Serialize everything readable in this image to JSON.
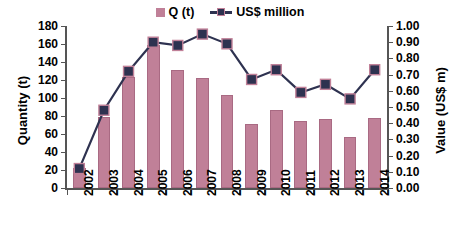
{
  "chart_data": {
    "type": "bar",
    "title": "",
    "subtitle": "",
    "xlabel": "",
    "ylabel": "Quantity (t)",
    "y2label": "Value (US$ m)",
    "categories": [
      "2002",
      "2003",
      "2004",
      "2005",
      "2006",
      "2007",
      "2008",
      "2009",
      "2010",
      "2011",
      "2012",
      "2013",
      "2014"
    ],
    "ylim": [
      0,
      180
    ],
    "y2lim": [
      0,
      1.0
    ],
    "yticks": [
      0,
      20,
      40,
      60,
      80,
      100,
      120,
      140,
      160,
      180
    ],
    "ytick_labels": [
      "0",
      "20",
      "40",
      "60",
      "80",
      "100",
      "120",
      "140",
      "160",
      "180"
    ],
    "y2ticks": [
      0.0,
      0.1,
      0.2,
      0.3,
      0.4,
      0.5,
      0.6,
      0.7,
      0.8,
      0.9,
      1.0
    ],
    "y2tick_labels": [
      "0.00",
      "0.10",
      "0.20",
      "0.30",
      "0.40",
      "0.50",
      "0.60",
      "0.70",
      "0.80",
      "0.90",
      "1.00"
    ],
    "grid": false,
    "legend_position": "top-center",
    "series": [
      {
        "name": "Q (t)",
        "type": "bar",
        "axis": "left",
        "color": "#C08098",
        "values": [
          22,
          79,
          123,
          159,
          131,
          122,
          103,
          71,
          87,
          74,
          77,
          57,
          78
        ]
      },
      {
        "name": "US$ million",
        "type": "line",
        "axis": "right",
        "color": "#2E3250",
        "marker": "square",
        "values": [
          0.12,
          0.48,
          0.72,
          0.9,
          0.88,
          0.95,
          0.89,
          0.67,
          0.73,
          0.59,
          0.64,
          0.55,
          0.73
        ]
      }
    ]
  },
  "legend": {
    "entries": [
      {
        "label": "Q (t)",
        "swatch": "bar-swatch-icon",
        "color": "#C08098"
      },
      {
        "label": "US$ million",
        "swatch": "line-marker-icon",
        "color": "#2E3250"
      }
    ]
  },
  "axes": {
    "left_title": "Quantity (t)",
    "right_title": "Value (US$ m)"
  },
  "colors": {
    "bar": "#C08098",
    "bar_edge": "#A96A83",
    "line": "#2E3250",
    "marker_fill": "#2E3250",
    "marker_edge": "#C08098",
    "axis": "#555555",
    "text": "#000000",
    "background": "#FFFFFF"
  }
}
